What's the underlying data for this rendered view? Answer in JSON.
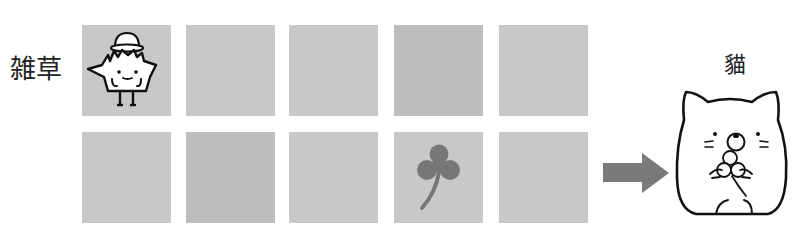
{
  "labels": {
    "grass": "雑草",
    "cat": "貓"
  },
  "grid": {
    "rows": 2,
    "cols": 5,
    "cells": [
      {
        "row": 0,
        "col": 0,
        "content": "weed-character-icon"
      },
      {
        "row": 0,
        "col": 1,
        "content": "empty"
      },
      {
        "row": 0,
        "col": 2,
        "content": "empty"
      },
      {
        "row": 0,
        "col": 3,
        "content": "empty"
      },
      {
        "row": 0,
        "col": 4,
        "content": "empty"
      },
      {
        "row": 1,
        "col": 0,
        "content": "empty"
      },
      {
        "row": 1,
        "col": 1,
        "content": "empty"
      },
      {
        "row": 1,
        "col": 2,
        "content": "empty"
      },
      {
        "row": 1,
        "col": 3,
        "content": "clover-icon"
      },
      {
        "row": 1,
        "col": 4,
        "content": "empty"
      }
    ]
  },
  "arrow": {
    "direction": "right",
    "icon": "arrow-right-icon"
  },
  "target": {
    "icon": "cat-holding-clover-icon"
  },
  "colors": {
    "cell": "#c8c8c8",
    "cell_dark": "#bdbdbd",
    "arrow": "#7a7a7a",
    "clover": "#777777",
    "outline": "#111111"
  }
}
